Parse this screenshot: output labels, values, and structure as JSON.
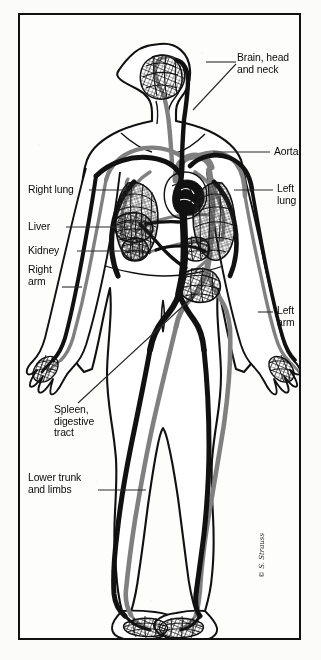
{
  "figure": {
    "kind": "anatomical-diagram",
    "border_color": "#111111",
    "background_color": "#fdfdfc"
  },
  "legend_colors": {
    "vein_deoxygenated": "#111111",
    "artery_oxygenated": "#808080",
    "body_outline": "#111111"
  },
  "labels": [
    {
      "id": "brain-head-neck",
      "lines": [
        "Brain, head",
        "and neck"
      ],
      "side": "right",
      "x": 237,
      "y": 55
    },
    {
      "id": "aorta",
      "lines": [
        "Aorta"
      ],
      "side": "right",
      "x": 271,
      "y": 148
    },
    {
      "id": "left-lung",
      "lines": [
        "Left",
        "lung"
      ],
      "side": "right",
      "x": 274,
      "y": 184
    },
    {
      "id": "left-arm",
      "lines": [
        "Left",
        "arm"
      ],
      "side": "right",
      "x": 274,
      "y": 306
    },
    {
      "id": "right-lung",
      "lines": [
        "Right lung"
      ],
      "side": "left",
      "x": 27,
      "y": 184
    },
    {
      "id": "liver",
      "lines": [
        "Liver"
      ],
      "side": "left",
      "x": 27,
      "y": 221
    },
    {
      "id": "kidney",
      "lines": [
        "Kidney"
      ],
      "side": "left",
      "x": 27,
      "y": 245
    },
    {
      "id": "right-arm",
      "lines": [
        "Right",
        "arm"
      ],
      "side": "left",
      "x": 27,
      "y": 264
    },
    {
      "id": "spleen-digestive-tract",
      "lines": [
        "Spleen,",
        "digestive",
        "tract"
      ],
      "side": "left",
      "x": 53,
      "y": 407
    },
    {
      "id": "lower-trunk-and-limbs",
      "lines": [
        "Lower trunk",
        "and limbs"
      ],
      "side": "left",
      "x": 27,
      "y": 473
    }
  ],
  "credit": {
    "text": "© S. Strauss",
    "x": 258,
    "y": 575
  }
}
